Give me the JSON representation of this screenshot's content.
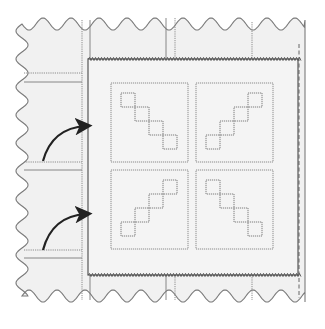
{
  "diagram": {
    "title": "",
    "colors": {
      "background": "#ffffff",
      "fabric_fill": "#f1f1f1",
      "block_fill": "#f4f4f4",
      "outline": "#7a7a7a",
      "stitch": "#8c8c8c",
      "arrow": "#222222"
    },
    "elements": {
      "fabric": "background-fabric-with-pinked-edges",
      "block": "square-quilt-block-with-zigzag-edges",
      "sub_blocks": [
        {
          "position": "top-left",
          "diagonal": "descending"
        },
        {
          "position": "top-right",
          "diagonal": "ascending"
        },
        {
          "position": "bottom-left",
          "diagonal": "ascending"
        },
        {
          "position": "bottom-right",
          "diagonal": "descending"
        }
      ],
      "squares_per_diagonal": 4,
      "arrows": [
        {
          "name": "upper-arrow",
          "direction": "right-up"
        },
        {
          "name": "lower-arrow",
          "direction": "right-up"
        }
      ]
    }
  }
}
